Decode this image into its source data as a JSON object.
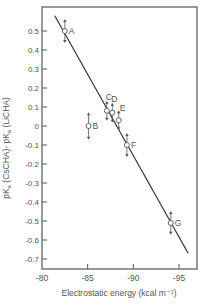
{
  "chart_data": {
    "type": "scatter",
    "title": "",
    "xlabel": "Electrostatic energy (kcal m⁻¹)",
    "ylabel": "pKa (CsCHA) - pKa (LiCHA)",
    "xlim": [
      -80,
      -97
    ],
    "ylim": [
      -0.75,
      0.62
    ],
    "grid": false,
    "legend": "none",
    "x_ticks": [
      -80,
      -85,
      -90,
      -95
    ],
    "x_tick_labels": [
      "-80",
      "-85",
      "-90",
      "-95"
    ],
    "y_ticks": [
      0.5,
      0.4,
      0.3,
      0.2,
      0.1,
      0,
      -0.1,
      -0.2,
      -0.3,
      -0.4,
      -0.5,
      -0.6,
      -0.7
    ],
    "y_tick_labels": [
      "0.5",
      "0.4",
      "0.3",
      "0.2",
      "0.1",
      "0",
      "-0.1",
      "-0.2",
      "-0.3",
      "-0.4",
      "-0.5",
      "-0.6",
      "-0.7"
    ],
    "points": [
      {
        "label": "A",
        "x": -82.5,
        "y": 0.5,
        "error": 0.06
      },
      {
        "label": "B",
        "x": -85.1,
        "y": 0.0,
        "error": 0.07
      },
      {
        "label": "C",
        "x": -87.1,
        "y": 0.08,
        "error": 0.05
      },
      {
        "label": "D",
        "x": -87.7,
        "y": 0.07,
        "error": 0.05
      },
      {
        "label": "E",
        "x": -88.4,
        "y": 0.03,
        "error": 0.05
      },
      {
        "label": "F",
        "x": -89.3,
        "y": -0.1,
        "error": 0.06
      },
      {
        "label": "G",
        "x": -94.1,
        "y": -0.51,
        "error": 0.06
      }
    ],
    "fit_line": {
      "x": [
        -81.4,
        -96.0
      ],
      "y": [
        0.58,
        -0.67
      ]
    }
  }
}
